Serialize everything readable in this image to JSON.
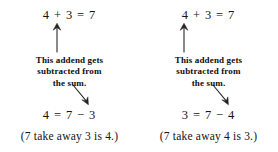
{
  "background_color": "#ffffff",
  "ink_color": "#141414",
  "diagram": {
    "panels": [
      {
        "id": "left",
        "equation_top": "4 + 3 = 7",
        "up_arrow": {
          "name": "up-arrow-to-second-addend",
          "points_to": "3",
          "direction": "up",
          "x": 57,
          "y_tail": 52,
          "y_head": 24
        },
        "caption": {
          "lines": [
            "This addend gets",
            "subtracted from",
            "the sum."
          ]
        },
        "down_arrow": {
          "name": "down-arrow-to-subtrahend",
          "points_to": "3",
          "direction": "down-right",
          "x_tail": 73,
          "y_tail": 85,
          "x_head": 88,
          "y_head": 105
        },
        "equation_bottom": "4 = 7 − 3",
        "takeaway": "(7 take away 3 is 4.)"
      },
      {
        "id": "right",
        "equation_top": "4 + 3 = 7",
        "up_arrow": {
          "name": "up-arrow-to-first-addend",
          "points_to": "4",
          "direction": "up",
          "x": 53,
          "y_tail": 52,
          "y_head": 24
        },
        "caption": {
          "lines": [
            "This addend gets",
            "subtracted from",
            "the sum."
          ]
        },
        "down_arrow": {
          "name": "down-arrow-to-subtrahend",
          "points_to": "4",
          "direction": "down-right",
          "x_tail": 74,
          "y_tail": 85,
          "x_head": 89,
          "y_head": 105
        },
        "equation_bottom": "3 = 7 − 4",
        "takeaway": "(7 take away 4 is 3.)"
      }
    ]
  }
}
